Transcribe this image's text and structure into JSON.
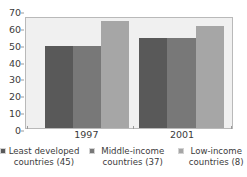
{
  "chart_data": {
    "type": "bar",
    "title": "",
    "xlabel": "",
    "ylabel": "",
    "categories": [
      "1997",
      "2001"
    ],
    "series": [
      {
        "name": "Least developed countries (45)",
        "values": [
          52,
          57
        ],
        "color": "#595959"
      },
      {
        "name": "Middle-income countries (37)",
        "values": [
          52,
          57
        ],
        "color": "#787878"
      },
      {
        "name": "Low-income countries (8)",
        "values": [
          68,
          65
        ],
        "color": "#a6a6a6"
      }
    ],
    "ylim": [
      0,
      70
    ],
    "y_ticks": [
      0,
      10,
      20,
      30,
      40,
      50,
      60,
      70
    ],
    "y_tick_labels": [
      "0",
      "10",
      "20",
      "30",
      "40",
      "50",
      "60",
      "70"
    ],
    "grid": false,
    "legend_position": "bottom",
    "plot_background": "#f0f0f0",
    "plot_border": "#b9b9b9",
    "page_background": "#ffffff",
    "text_color": "#3b3b3b"
  }
}
